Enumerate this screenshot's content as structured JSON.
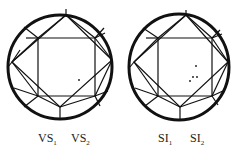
{
  "diagrams": [
    {
      "name": "vs-clarity",
      "labels": [
        {
          "main": "VS",
          "sub": "1"
        },
        {
          "main": "VS",
          "sub": "2"
        }
      ],
      "inclusions": [
        [
          79,
          81
        ]
      ]
    },
    {
      "name": "si-clarity",
      "labels": [
        {
          "main": "SI",
          "sub": "1"
        },
        {
          "main": "SI",
          "sub": "2"
        }
      ],
      "inclusions": [
        [
          196,
          66
        ],
        [
          193,
          77
        ],
        [
          190,
          81
        ],
        [
          197,
          77
        ]
      ]
    }
  ],
  "colors": {
    "line": "#111111",
    "background": "#ffffff"
  }
}
